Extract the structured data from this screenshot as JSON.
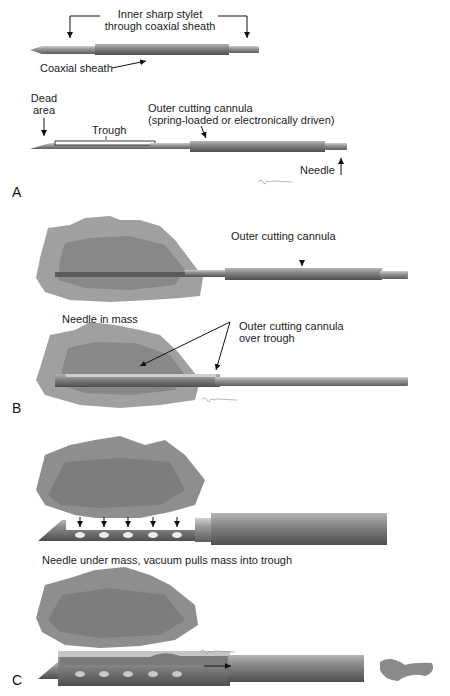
{
  "figure": {
    "panels": [
      {
        "id": "A",
        "letter": "A",
        "labels": {
          "stylet": "Inner sharp stylet",
          "stylet2": "through coaxial sheath",
          "sheath": "Coaxial sheath",
          "dead": "Dead",
          "dead2": "area",
          "trough": "Trough",
          "cannula": "Outer cutting cannula",
          "cannula2": "(spring-loaded or electronically driven)",
          "needle": "Needle"
        }
      },
      {
        "id": "B",
        "letter": "B",
        "labels": {
          "cannula": "Outer cutting cannula",
          "needle_in_mass": "Needle in mass",
          "over_trough": "Outer cutting cannula",
          "over_trough2": "over trough"
        }
      },
      {
        "id": "C",
        "letter": "C",
        "labels": {
          "caption": "Needle under mass, vacuum pulls mass into trough"
        }
      }
    ],
    "colors": {
      "needle_dark": "#6e6e6e",
      "needle_mid": "#8c8c8c",
      "needle_light": "#c4c4c4",
      "mass_outer": "#9a9a9a",
      "mass_inner": "#858585",
      "trough_fill": "#ffffff",
      "hole": "#e8e8e8"
    }
  }
}
